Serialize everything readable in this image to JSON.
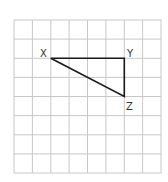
{
  "diagram": {
    "type": "grid-triangle",
    "grid": {
      "columns": 8,
      "rows": 8,
      "line_color": "#c8c8c8"
    },
    "triangle": {
      "stroke_color": "#1a1a1a",
      "vertices": [
        {
          "label": "X",
          "col": 2,
          "row": 2
        },
        {
          "label": "Y",
          "col": 6,
          "row": 2
        },
        {
          "label": "Z",
          "col": 6,
          "row": 4
        }
      ]
    },
    "labels": {
      "x": "X",
      "y": "Y",
      "z": "Z"
    }
  }
}
